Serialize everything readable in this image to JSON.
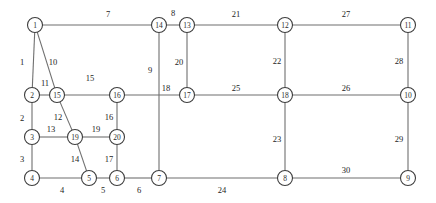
{
  "figure": {
    "title": "",
    "background_color": "#ffffff",
    "node_fill": "#ffffff",
    "node_stroke": "#3d3d3d",
    "edge_color": "#6f6f6f",
    "label_color": "#1d1d1d",
    "node_radius": 7.5,
    "width": 436,
    "height": 203
  },
  "chart_data": {
    "type": "diagram",
    "diagram_kind": "undirected-graph",
    "node_count": 20,
    "edge_count": 30,
    "nodes": [
      {
        "id": "1",
        "label": "1",
        "x": 35,
        "y": 25
      },
      {
        "id": "2",
        "label": "2",
        "x": 32,
        "y": 95
      },
      {
        "id": "3",
        "label": "3",
        "x": 32,
        "y": 137
      },
      {
        "id": "4",
        "label": "4",
        "x": 32,
        "y": 178
      },
      {
        "id": "5",
        "label": "5",
        "x": 89,
        "y": 178
      },
      {
        "id": "6",
        "label": "6",
        "x": 117,
        "y": 178
      },
      {
        "id": "7",
        "label": "7",
        "x": 159,
        "y": 178
      },
      {
        "id": "8",
        "label": "8",
        "x": 285,
        "y": 178
      },
      {
        "id": "9",
        "label": "9",
        "x": 408,
        "y": 178
      },
      {
        "id": "10",
        "label": "10",
        "x": 408,
        "y": 95
      },
      {
        "id": "11",
        "label": "11",
        "x": 408,
        "y": 25
      },
      {
        "id": "12",
        "label": "12",
        "x": 285,
        "y": 25
      },
      {
        "id": "13",
        "label": "13",
        "x": 187,
        "y": 25
      },
      {
        "id": "14",
        "label": "14",
        "x": 159,
        "y": 25
      },
      {
        "id": "15",
        "label": "15",
        "x": 57,
        "y": 95
      },
      {
        "id": "16",
        "label": "16",
        "x": 117,
        "y": 95
      },
      {
        "id": "17",
        "label": "17",
        "x": 187,
        "y": 95
      },
      {
        "id": "18",
        "label": "18",
        "x": 285,
        "y": 95
      },
      {
        "id": "19",
        "label": "19",
        "x": 75,
        "y": 137
      },
      {
        "id": "20",
        "label": "20",
        "x": 117,
        "y": 137
      }
    ],
    "edges": [
      {
        "label": "1",
        "source": "1",
        "target": "2",
        "lx": 22,
        "ly": 62
      },
      {
        "label": "2",
        "source": "2",
        "target": "3",
        "lx": 22,
        "ly": 118
      },
      {
        "label": "3",
        "source": "3",
        "target": "4",
        "lx": 22,
        "ly": 159
      },
      {
        "label": "4",
        "source": "4",
        "target": "5",
        "lx": 62,
        "ly": 190
      },
      {
        "label": "5",
        "source": "5",
        "target": "6",
        "lx": 103,
        "ly": 190
      },
      {
        "label": "6",
        "source": "6",
        "target": "7",
        "lx": 139,
        "ly": 190
      },
      {
        "label": "7",
        "source": "1",
        "target": "14",
        "lx": 108,
        "ly": 14
      },
      {
        "label": "8",
        "source": "14",
        "target": "13",
        "lx": 173,
        "ly": 13
      },
      {
        "label": "9",
        "source": "14",
        "target": "7",
        "lx": 150,
        "ly": 70
      },
      {
        "label": "10",
        "source": "1",
        "target": "15",
        "lx": 53,
        "ly": 62
      },
      {
        "label": "11",
        "source": "2",
        "target": "15",
        "lx": 45,
        "ly": 83
      },
      {
        "label": "12",
        "source": "15",
        "target": "19",
        "lx": 58,
        "ly": 117
      },
      {
        "label": "13",
        "source": "3",
        "target": "19",
        "lx": 51,
        "ly": 129
      },
      {
        "label": "14",
        "source": "19",
        "target": "5",
        "lx": 75,
        "ly": 159
      },
      {
        "label": "15",
        "source": "15",
        "target": "16",
        "lx": 90,
        "ly": 78
      },
      {
        "label": "16",
        "source": "16",
        "target": "20",
        "lx": 109,
        "ly": 117
      },
      {
        "label": "17",
        "source": "20",
        "target": "6",
        "lx": 109,
        "ly": 159
      },
      {
        "label": "18",
        "source": "16",
        "target": "17",
        "lx": 166,
        "ly": 88
      },
      {
        "label": "19",
        "source": "19",
        "target": "20",
        "lx": 96,
        "ly": 129
      },
      {
        "label": "20",
        "source": "13",
        "target": "17",
        "lx": 179,
        "ly": 62
      },
      {
        "label": "21",
        "source": "13",
        "target": "12",
        "lx": 236,
        "ly": 14
      },
      {
        "label": "22",
        "source": "12",
        "target": "18",
        "lx": 277,
        "ly": 61
      },
      {
        "label": "23",
        "source": "18",
        "target": "8",
        "lx": 277,
        "ly": 139
      },
      {
        "label": "24",
        "source": "7",
        "target": "8",
        "lx": 222,
        "ly": 190
      },
      {
        "label": "25",
        "source": "17",
        "target": "18",
        "lx": 236,
        "ly": 88
      },
      {
        "label": "26",
        "source": "18",
        "target": "10",
        "lx": 346,
        "ly": 88
      },
      {
        "label": "27",
        "source": "12",
        "target": "11",
        "lx": 346,
        "ly": 14
      },
      {
        "label": "28",
        "source": "11",
        "target": "10",
        "lx": 399,
        "ly": 61
      },
      {
        "label": "29",
        "source": "10",
        "target": "9",
        "lx": 399,
        "ly": 139
      },
      {
        "label": "30",
        "source": "8",
        "target": "9",
        "lx": 346,
        "ly": 170
      }
    ]
  }
}
